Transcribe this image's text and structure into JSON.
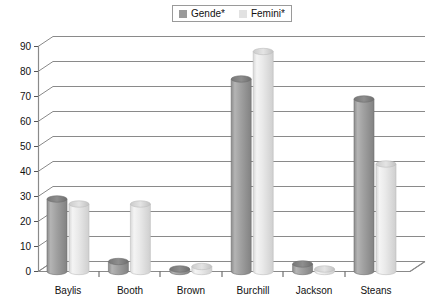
{
  "legend": {
    "entries": [
      {
        "label": "Gende*",
        "color": "#9a9a9a"
      },
      {
        "label": "Femini*",
        "color": "#e2e2e2"
      }
    ]
  },
  "axes": {
    "y_ticks": [
      "0",
      "10",
      "20",
      "30",
      "40",
      "50",
      "60",
      "70",
      "80",
      "90"
    ],
    "x_categories": [
      "Baylis",
      "Booth",
      "Brown",
      "Burchill",
      "Jackson",
      "Steans"
    ]
  },
  "chart_data": {
    "type": "bar",
    "title": "",
    "xlabel": "",
    "ylabel": "",
    "ylim": [
      0,
      90
    ],
    "grid": true,
    "legend_position": "top-center",
    "categories": [
      "Baylis",
      "Booth",
      "Brown",
      "Burchill",
      "Jackson",
      "Steans"
    ],
    "series": [
      {
        "name": "Gende*",
        "color": "#9a9a9a",
        "values": [
          29,
          4,
          1,
          77,
          3,
          69
        ]
      },
      {
        "name": "Femini*",
        "color": "#e2e2e2",
        "values": [
          27,
          27,
          2,
          88,
          1,
          43
        ]
      }
    ]
  }
}
